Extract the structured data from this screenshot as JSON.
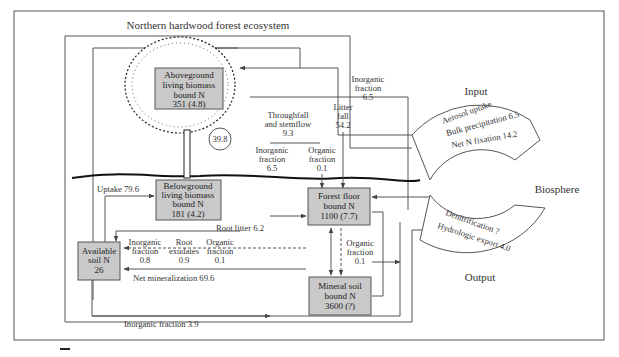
{
  "diagram": {
    "title": "Northern hardwood forest ecosystem",
    "pools": {
      "aboveground": {
        "lines": [
          "Aboveground",
          "living biomass",
          "bound N",
          "351 (4.8)"
        ]
      },
      "belowground": {
        "lines": [
          "Belowground",
          "living biomass",
          "bound N",
          "181 (4.2)"
        ]
      },
      "available_soil": {
        "lines": [
          "Available",
          "soil N",
          "26"
        ]
      },
      "forest_floor": {
        "lines": [
          "Forest floor",
          "bound N",
          "1100 (7.7)"
        ]
      },
      "mineral_soil": {
        "lines": [
          "Mineral soil",
          "bound N",
          "3600 (?)"
        ]
      }
    },
    "flows": {
      "internal_cycle": "39.8",
      "throughfall": {
        "lines": [
          "Throughfall",
          "and stemflow",
          "9.3"
        ]
      },
      "tf_inorganic": {
        "lines": [
          "Inorganic",
          "fraction",
          "6.5"
        ]
      },
      "tf_organic": {
        "lines": [
          "Organic",
          "fraction",
          "0.1"
        ]
      },
      "litter_fall": {
        "lines": [
          "Litter",
          "fall",
          "54.2"
        ]
      },
      "input_inorganic": {
        "lines": [
          "Inorganic",
          "fraction",
          "6.5"
        ]
      },
      "uptake": "Uptake 79.6",
      "root_litter": "Root litter 6.2",
      "root_inorganic": {
        "lines": [
          "Inorganic",
          "fraction",
          "0.8"
        ]
      },
      "root_exudates": {
        "lines": [
          "Root",
          "exudates",
          "0.9"
        ]
      },
      "root_organic": {
        "lines": [
          "Organic",
          "fraction",
          "0.1"
        ]
      },
      "net_mineralization": "Net mineralization 69.6",
      "ff_organic": {
        "lines": [
          "Organic",
          "fraction",
          "0.1"
        ]
      },
      "inorganic_export": "Inorganic fraction 3.9"
    },
    "biosphere": {
      "label": "Biosphere",
      "input_label": "Input",
      "output_label": "Output",
      "inputs": [
        "Aerosol uptake",
        "Bulk precipitation 6.5",
        "Net N fixation 14.2"
      ],
      "outputs": [
        "Denitrification ?",
        "Hydrologic export 4.0"
      ]
    }
  },
  "colors": {
    "box_fill": "#c9c9c9",
    "line": "#555555",
    "text": "#333333"
  }
}
